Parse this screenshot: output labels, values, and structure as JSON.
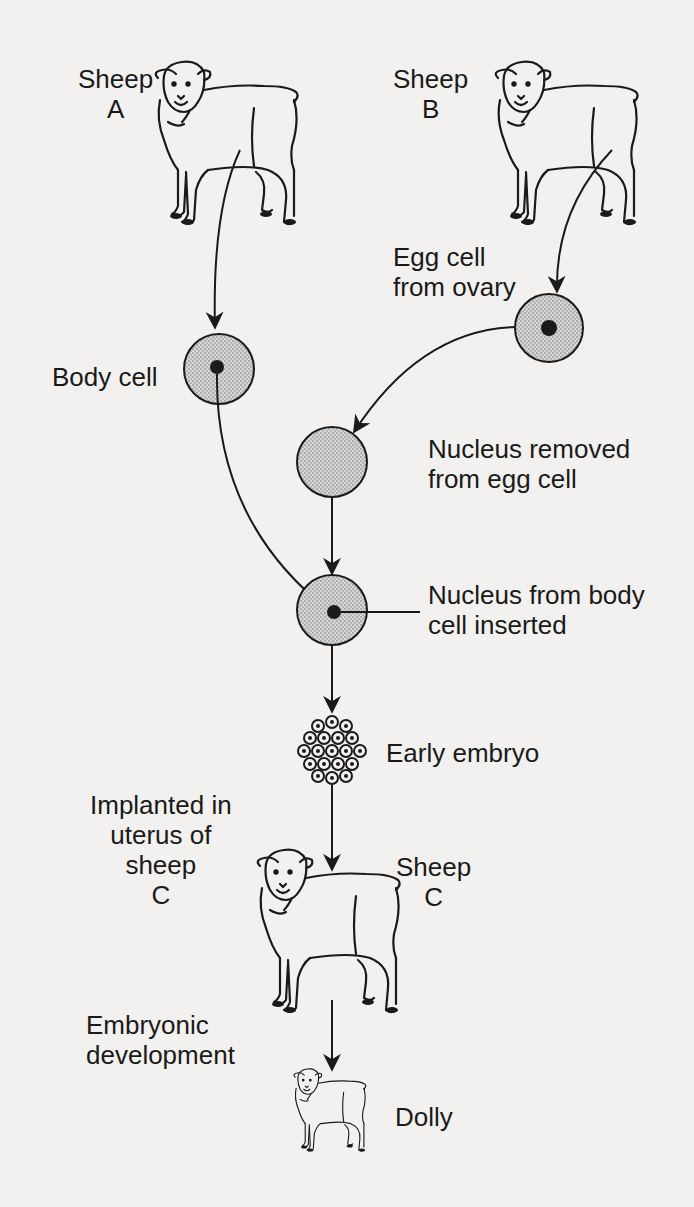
{
  "diagram": {
    "labels": {
      "sheep_a": [
        "Sheep",
        "A"
      ],
      "sheep_b": [
        "Sheep",
        "B"
      ],
      "egg_cell": [
        "Egg cell",
        "from ovary"
      ],
      "body_cell": [
        "Body cell"
      ],
      "nucleus_removed": [
        "Nucleus removed",
        "from egg cell"
      ],
      "nucleus_inserted": [
        "Nucleus from body",
        "cell inserted"
      ],
      "early_embryo": [
        "Early embryo"
      ],
      "implanted": [
        "Implanted in",
        "uterus of",
        "sheep",
        "C"
      ],
      "sheep_c": [
        "Sheep",
        "C"
      ],
      "embryonic": [
        "Embryonic",
        "development"
      ],
      "dolly": [
        "Dolly"
      ]
    },
    "colors": {
      "background": "#f2f1ef",
      "ink": "#1a1a1a",
      "cell_fill": "#c9c9c9"
    },
    "flow": [
      "Sheep A -> Body cell",
      "Sheep B -> Egg cell from ovary",
      "Egg cell -> Nucleus removed from egg cell",
      "Body cell nucleus -> Nucleus from body cell inserted",
      "Nucleus removed -> Nucleus from body cell inserted",
      "Nucleus from body cell inserted -> Early embryo",
      "Early embryo -> Implanted in uterus of sheep C",
      "Sheep C -> Dolly"
    ]
  }
}
